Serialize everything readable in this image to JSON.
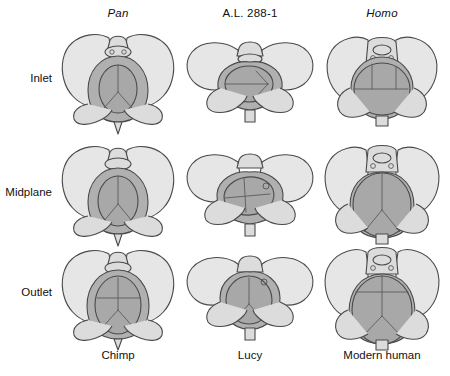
{
  "figure": {
    "title_visible": false,
    "background_color": "#ffffff",
    "palette": {
      "bone_fill": "#dcdcdc",
      "bone_fill_light": "#e6e6e6",
      "canal_fill": "#b0b0b0",
      "head_fill": "#a8a8a8",
      "outline": "#4a4a4a",
      "suture_line": "#5a5a5a",
      "text": "#111111"
    },
    "columns": [
      {
        "id": "pan",
        "header": "Pan",
        "header_style": "italic",
        "footer": "Chimp"
      },
      {
        "id": "al288",
        "header": "A.L. 288-1",
        "header_style": "normal",
        "footer": "Lucy"
      },
      {
        "id": "homo",
        "header": "Homo",
        "header_style": "italic",
        "footer": "Modern human"
      }
    ],
    "rows": [
      {
        "id": "inlet",
        "label": "Inlet"
      },
      {
        "id": "midplane",
        "label": "Midplane"
      },
      {
        "id": "outlet",
        "label": "Outlet"
      }
    ],
    "cells": [
      {
        "row": "inlet",
        "column": "pan",
        "caption": "Chimpanzee pelvic inlet with fetal head in anteroposterior orientation"
      },
      {
        "row": "inlet",
        "column": "al288",
        "caption": "A.L. 288-1 pelvic inlet, wide platypelloid canal with fetal head transverse"
      },
      {
        "row": "inlet",
        "column": "homo",
        "caption": "Modern human pelvic inlet, round canal with fetal head transverse"
      },
      {
        "row": "midplane",
        "column": "pan",
        "caption": "Chimpanzee midplane, fetal head anteroposterior"
      },
      {
        "row": "midplane",
        "column": "al288",
        "caption": "A.L. 288-1 midplane, fetal head transverse"
      },
      {
        "row": "midplane",
        "column": "homo",
        "caption": "Modern human midplane, fetal head rotating"
      },
      {
        "row": "outlet",
        "column": "pan",
        "caption": "Chimpanzee pelvic outlet, fetal head anteroposterior"
      },
      {
        "row": "outlet",
        "column": "al288",
        "caption": "A.L. 288-1 pelvic outlet, fetal head transverse"
      },
      {
        "row": "outlet",
        "column": "homo",
        "caption": "Modern human pelvic outlet, fetal head anteroposterior"
      }
    ]
  }
}
